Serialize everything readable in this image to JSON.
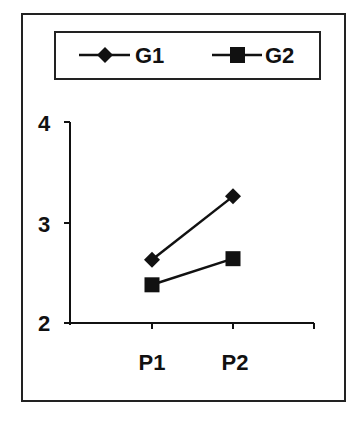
{
  "chart_data": {
    "type": "line",
    "title": "",
    "xlabel": "",
    "ylabel": "",
    "categories": [
      "P1",
      "P2"
    ],
    "series": [
      {
        "name": "G1",
        "marker": "diamond",
        "values": [
          2.63,
          3.26
        ]
      },
      {
        "name": "G2",
        "marker": "square",
        "values": [
          2.38,
          2.64
        ]
      }
    ],
    "ylim": [
      2,
      4
    ],
    "yticks": [
      "2",
      "3",
      "4"
    ],
    "grid": false,
    "legend_position": "top"
  },
  "colors": {
    "line": "#111111",
    "frame": "#222222",
    "background": "#ffffff"
  }
}
